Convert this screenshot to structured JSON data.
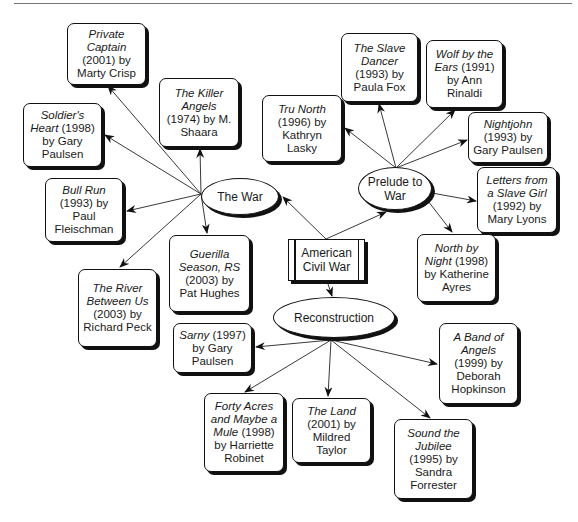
{
  "center": {
    "label_line1": "American",
    "label_line2": "Civil War"
  },
  "themes": {
    "the_war": {
      "label": "The War"
    },
    "prelude": {
      "label_line1": "Prelude to",
      "label_line2": "War"
    },
    "reconstruction": {
      "label": "Reconstruction"
    }
  },
  "books": {
    "private_captain": {
      "title": "Private Captain",
      "year": "(2001) by",
      "author": "Marty Crisp",
      "theme": "The War"
    },
    "killer_angels": {
      "title": "The Killer Angels",
      "year": "(1974) by M.",
      "author": "Shaara",
      "theme": "The War"
    },
    "soldiers_heart": {
      "title": "Soldier's Heart",
      "year": "(1998)",
      "author": "by Gary Paulsen",
      "theme": "The War"
    },
    "bull_run": {
      "title": "Bull Run",
      "year": "(1993) by",
      "author": "Paul Fleischman",
      "theme": "The War"
    },
    "river_between_us": {
      "title": "The River Between Us",
      "year": "(2003) by",
      "author": "Richard Peck",
      "theme": "The War"
    },
    "guerilla_season": {
      "title": "Guerilla Season, RS",
      "year": "(2003) by",
      "author": "Pat Hughes",
      "theme": "The War"
    },
    "tru_north": {
      "title": "Tru North",
      "year": "(1996) by",
      "author": "Kathryn Lasky",
      "theme": "Prelude to War"
    },
    "slave_dancer": {
      "title": "The Slave Dancer",
      "year": "(1993) by",
      "author": "Paula Fox",
      "theme": "Prelude to War"
    },
    "wolf_by_the_ears": {
      "title": "Wolf by the Ears",
      "year": "(1991)",
      "author": "by Ann Rinaldi",
      "theme": "Prelude to War"
    },
    "nightjohn": {
      "title": "Nightjohn",
      "year": "(1993) by",
      "author": "Gary Paulsen",
      "theme": "Prelude to War"
    },
    "letters_slave_girl": {
      "title": "Letters from a Slave Girl",
      "year": "(1992) by",
      "author": "Mary Lyons",
      "theme": "Prelude to War"
    },
    "north_by_night": {
      "title": "North by Night",
      "year": "(1998)",
      "author": "by Katherine Ayres",
      "theme": "Prelude to War"
    },
    "sarny": {
      "title": "Sarny",
      "year": "(1997)",
      "author": "by Gary Paulsen",
      "theme": "Reconstruction"
    },
    "forty_acres": {
      "title": "Forty Acres and Maybe a Mule",
      "year": "(1998)",
      "author": "by Harriette Robinet",
      "theme": "Reconstruction"
    },
    "the_land": {
      "title": "The Land",
      "year": "(2001) by",
      "author": "Mildred Taylor",
      "theme": "Reconstruction"
    },
    "sound_the_jubilee": {
      "title": "Sound the Jubilee",
      "year": "(1995) by",
      "author": "Sandra Forrester",
      "theme": "Reconstruction"
    },
    "band_of_angels": {
      "title": "A Band of Angels",
      "year": "(1999) by",
      "author": "Deborah Hopkinson",
      "theme": "Reconstruction"
    }
  }
}
